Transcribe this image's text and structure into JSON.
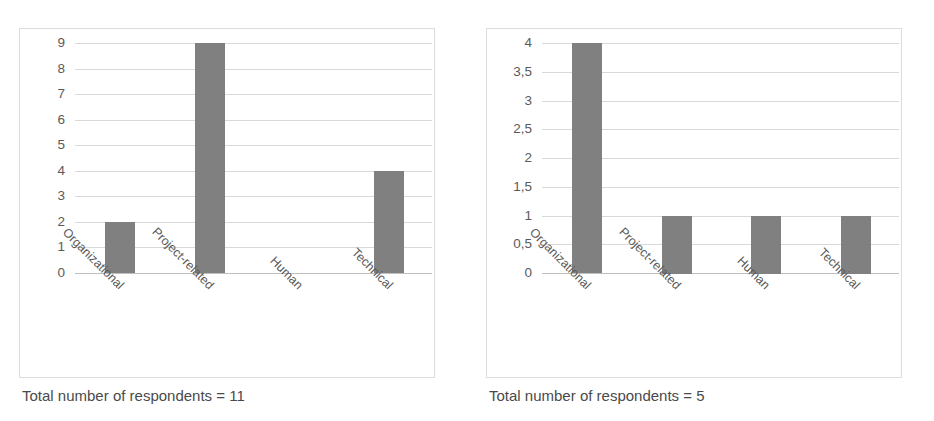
{
  "figure": {
    "panels": [
      {
        "id": "left",
        "caption": "Total number of respondents = 11",
        "chart_data": {
          "type": "bar",
          "title": "",
          "xlabel": "",
          "ylabel": "",
          "categories": [
            "Organizational",
            "Project-related",
            "Human",
            "Technical"
          ],
          "values": [
            2,
            9,
            0,
            4
          ],
          "ytick_labels": [
            "0",
            "1",
            "2",
            "3",
            "4",
            "5",
            "6",
            "7",
            "8",
            "9"
          ],
          "ytick_values": [
            0,
            1,
            2,
            3,
            4,
            5,
            6,
            7,
            8,
            9
          ],
          "ylim": [
            0,
            9
          ],
          "grid": true,
          "legend": "none",
          "bar_color": "#808080",
          "grid_color": "#d9d9d9",
          "frame_color": "#dcdcdc"
        }
      },
      {
        "id": "right",
        "caption": "Total number of respondents = 5",
        "chart_data": {
          "type": "bar",
          "title": "",
          "xlabel": "",
          "ylabel": "",
          "categories": [
            "Organizational",
            "Project-related",
            "Human",
            "Technical"
          ],
          "values": [
            4,
            1,
            1,
            1
          ],
          "ytick_labels": [
            "0",
            "0,5",
            "1",
            "1,5",
            "2",
            "2,5",
            "3",
            "3,5",
            "4"
          ],
          "ytick_values": [
            0,
            0.5,
            1,
            1.5,
            2,
            2.5,
            3,
            3.5,
            4
          ],
          "ylim": [
            0,
            4
          ],
          "grid": true,
          "legend": "none",
          "bar_color": "#808080",
          "grid_color": "#d9d9d9",
          "frame_color": "#dcdcdc"
        }
      }
    ]
  }
}
